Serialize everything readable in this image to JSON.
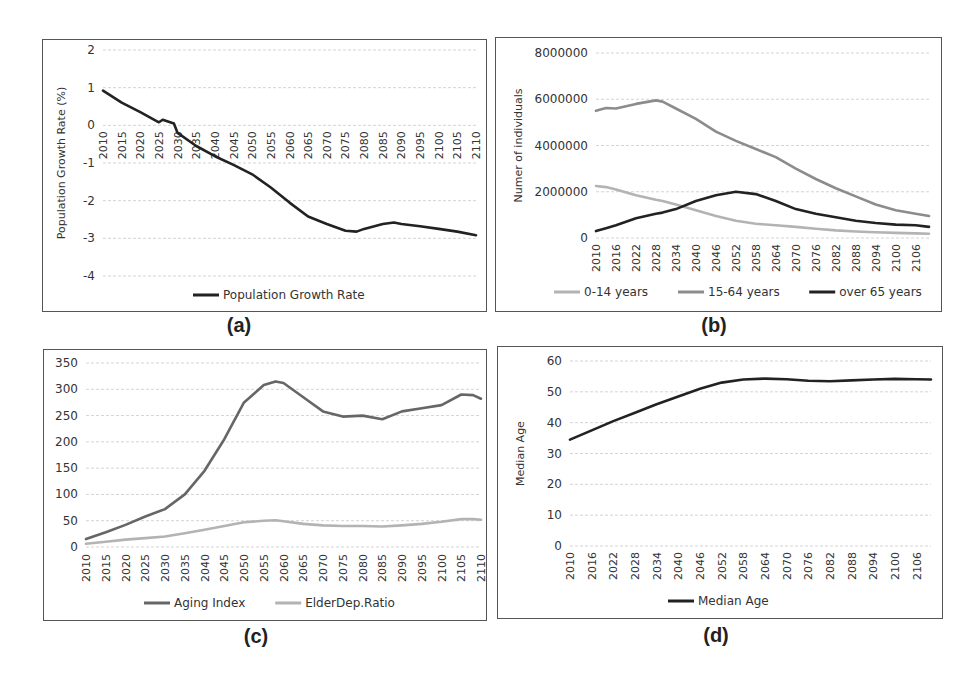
{
  "captions": {
    "a": "(a)",
    "b": "(b)",
    "c": "(c)",
    "d": "(d)"
  },
  "chart_data": [
    {
      "id": "a",
      "type": "line",
      "title": "",
      "xlabel": "",
      "ylabel": "Population Growth Rate (%)",
      "ylim": [
        -4,
        2
      ],
      "yticks": [
        "2",
        "1",
        "0",
        "-1",
        "-2",
        "-3",
        "-4"
      ],
      "grid": true,
      "legend_position": "bottom",
      "x_tick_labels": [
        "2010",
        "2015",
        "2020",
        "2025",
        "2030",
        "2035",
        "2040",
        "2045",
        "2050",
        "2055",
        "2060",
        "2065",
        "2070",
        "2075",
        "2080",
        "2085",
        "2090",
        "2095",
        "2100",
        "2105",
        "2110"
      ],
      "x": [
        2010,
        2015,
        2020,
        2025,
        2026,
        2029,
        2030,
        2035,
        2040,
        2045,
        2050,
        2055,
        2060,
        2065,
        2070,
        2075,
        2078,
        2080,
        2085,
        2088,
        2090,
        2095,
        2100,
        2105,
        2110
      ],
      "series": [
        {
          "name": "Population Growth Rate",
          "color": "#222222",
          "values": [
            0.92,
            0.6,
            0.35,
            0.08,
            0.15,
            0.05,
            -0.2,
            -0.55,
            -0.82,
            -1.05,
            -1.3,
            -1.65,
            -2.05,
            -2.42,
            -2.62,
            -2.8,
            -2.82,
            -2.75,
            -2.62,
            -2.58,
            -2.62,
            -2.68,
            -2.75,
            -2.82,
            -2.92
          ]
        }
      ]
    },
    {
      "id": "b",
      "type": "line",
      "title": "",
      "xlabel": "",
      "ylabel": "Numer of individuals",
      "ylim": [
        0,
        8000000
      ],
      "yticks": [
        "8000000",
        "6000000",
        "4000000",
        "2000000",
        "0"
      ],
      "grid": true,
      "legend_position": "bottom",
      "x_tick_labels": [
        "2010",
        "2016",
        "2022",
        "2028",
        "2034",
        "2040",
        "2046",
        "2052",
        "2058",
        "2064",
        "2070",
        "2076",
        "2082",
        "2088",
        "2094",
        "2100",
        "2106"
      ],
      "x": [
        2010,
        2013,
        2016,
        2022,
        2028,
        2030,
        2034,
        2040,
        2046,
        2052,
        2058,
        2064,
        2070,
        2076,
        2082,
        2088,
        2094,
        2100,
        2106,
        2110
      ],
      "series": [
        {
          "name": "0-14 years",
          "color": "#b3b3b3",
          "values": [
            2250000,
            2200000,
            2100000,
            1850000,
            1650000,
            1600000,
            1450000,
            1200000,
            950000,
            750000,
            620000,
            550000,
            480000,
            400000,
            330000,
            280000,
            250000,
            220000,
            200000,
            180000
          ]
        },
        {
          "name": "15-64 years",
          "color": "#8c8c8c",
          "values": [
            5500000,
            5620000,
            5600000,
            5800000,
            5950000,
            5900000,
            5600000,
            5150000,
            4600000,
            4200000,
            3850000,
            3500000,
            3000000,
            2550000,
            2150000,
            1800000,
            1450000,
            1200000,
            1050000,
            950000
          ]
        },
        {
          "name": "over 65 years",
          "color": "#222222",
          "values": [
            300000,
            420000,
            550000,
            850000,
            1050000,
            1100000,
            1250000,
            1600000,
            1850000,
            2000000,
            1900000,
            1600000,
            1250000,
            1050000,
            900000,
            750000,
            650000,
            580000,
            550000,
            480000
          ]
        }
      ]
    },
    {
      "id": "c",
      "type": "line",
      "title": "",
      "xlabel": "",
      "ylabel": "",
      "ylim": [
        0,
        350
      ],
      "yticks": [
        "350",
        "300",
        "250",
        "200",
        "150",
        "100",
        "50",
        "0"
      ],
      "grid": true,
      "legend_position": "bottom",
      "x_tick_labels": [
        "2010",
        "2015",
        "2020",
        "2025",
        "2030",
        "2035",
        "2040",
        "2045",
        "2050",
        "2055",
        "2060",
        "2065",
        "2070",
        "2075",
        "2080",
        "2085",
        "2090",
        "2095",
        "2100",
        "2105",
        "2110"
      ],
      "x": [
        2010,
        2015,
        2020,
        2025,
        2030,
        2035,
        2040,
        2045,
        2050,
        2055,
        2058,
        2060,
        2065,
        2070,
        2075,
        2080,
        2085,
        2090,
        2095,
        2100,
        2105,
        2108,
        2110
      ],
      "series": [
        {
          "name": "Aging Index",
          "color": "#666666",
          "values": [
            15,
            28,
            42,
            58,
            72,
            100,
            145,
            205,
            275,
            308,
            315,
            312,
            285,
            258,
            248,
            250,
            243,
            258,
            264,
            270,
            290,
            289,
            282
          ]
        },
        {
          "name": "ElderDep.Ratio",
          "color": "#b3b3b3",
          "values": [
            6,
            10,
            14,
            17,
            20,
            26,
            33,
            40,
            47,
            50,
            51,
            49,
            44,
            41,
            40,
            40,
            39,
            41,
            44,
            48,
            53,
            53,
            52
          ]
        }
      ]
    },
    {
      "id": "d",
      "type": "line",
      "title": "",
      "xlabel": "",
      "ylabel": "Median Age",
      "ylim": [
        0,
        60
      ],
      "yticks": [
        "60",
        "50",
        "40",
        "30",
        "20",
        "10",
        "0"
      ],
      "grid": true,
      "legend_position": "bottom",
      "x_tick_labels": [
        "2010",
        "2016",
        "2022",
        "2028",
        "2034",
        "2040",
        "2046",
        "2052",
        "2058",
        "2064",
        "2070",
        "2076",
        "2082",
        "2088",
        "2094",
        "2100",
        "2106"
      ],
      "x": [
        2010,
        2016,
        2022,
        2028,
        2034,
        2040,
        2046,
        2052,
        2058,
        2064,
        2070,
        2076,
        2082,
        2088,
        2094,
        2100,
        2106,
        2110
      ],
      "series": [
        {
          "name": "Median Age",
          "color": "#222222",
          "values": [
            34.5,
            37.5,
            40.5,
            43.2,
            46,
            48.5,
            51,
            53,
            54,
            54.3,
            54.1,
            53.6,
            53.4,
            53.7,
            54,
            54.2,
            54.1,
            54
          ]
        }
      ]
    }
  ]
}
